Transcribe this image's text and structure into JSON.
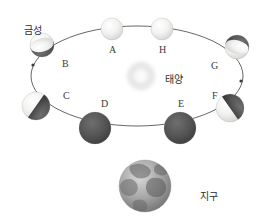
{
  "diagram": {
    "title_visible": false,
    "background_color": "#ffffff",
    "width": 269,
    "height": 220
  },
  "labels": {
    "venus": "금성",
    "sun": "태양",
    "earth": "지구"
  },
  "sun": {
    "name": "태양",
    "cx": 141,
    "cy": 76,
    "radius": 14,
    "color": "#efefef",
    "glow_color": "#f7f7f7"
  },
  "earth": {
    "name": "지구",
    "cx": 145,
    "cy": 186,
    "radius": 26,
    "color": "#9a9a9a",
    "label_x": 200,
    "label_y": 188
  },
  "orbit": {
    "cx": 137,
    "cy": 76,
    "rx": 106,
    "ry": 50,
    "stroke": "#555555",
    "stroke_width": 0.9,
    "direction": "counter-clockwise",
    "arrow_left": {
      "x": 33,
      "y": 65
    },
    "arrow_right": {
      "x": 241,
      "y": 81
    }
  },
  "positions": [
    {
      "id": "A",
      "label": "A",
      "cx": 112,
      "cy": 29,
      "radius": 11,
      "phase": "full",
      "lit_fraction": 1.0,
      "terminator_angle": 0,
      "label_x": 109,
      "label_y": 44
    },
    {
      "id": "B",
      "label": "B",
      "cx": 42,
      "cy": 45,
      "radius": 12,
      "phase": "gibbous",
      "lit_fraction": 0.78,
      "terminator_angle": 255,
      "label_x": 62,
      "label_y": 58
    },
    {
      "id": "C",
      "label": "C",
      "cx": 36,
      "cy": 106,
      "radius": 14,
      "phase": "quarter",
      "lit_fraction": 0.5,
      "terminator_angle": 215,
      "label_x": 63,
      "label_y": 90
    },
    {
      "id": "D",
      "label": "D",
      "cx": 95,
      "cy": 128,
      "radius": 16,
      "phase": "new",
      "lit_fraction": 0.05,
      "terminator_angle": 180,
      "label_x": 101,
      "label_y": 98
    },
    {
      "id": "E",
      "label": "E",
      "cx": 180,
      "cy": 128,
      "radius": 16,
      "phase": "new",
      "lit_fraction": 0.05,
      "terminator_angle": 180,
      "label_x": 178,
      "label_y": 98
    },
    {
      "id": "F",
      "label": "F",
      "cx": 230,
      "cy": 108,
      "radius": 14,
      "phase": "quarter",
      "lit_fraction": 0.5,
      "terminator_angle": 145,
      "label_x": 212,
      "label_y": 90
    },
    {
      "id": "G",
      "label": "G",
      "cx": 237,
      "cy": 47,
      "radius": 12,
      "phase": "gibbous",
      "lit_fraction": 0.78,
      "terminator_angle": 105,
      "label_x": 211,
      "label_y": 60
    },
    {
      "id": "H",
      "label": "H",
      "cx": 162,
      "cy": 29,
      "radius": 11,
      "phase": "full",
      "lit_fraction": 1.0,
      "terminator_angle": 0,
      "label_x": 159,
      "label_y": 44
    }
  ],
  "venus_label": {
    "text": "금성",
    "x": 24,
    "y": 22
  },
  "sun_label": {
    "text": "태양",
    "x": 165,
    "y": 71
  },
  "colors": {
    "lit": "#f0f0ee",
    "dark": "#4a4a4a",
    "mid": "#8c8c8c",
    "outline": "#6a6a6a",
    "text": "#333333"
  }
}
